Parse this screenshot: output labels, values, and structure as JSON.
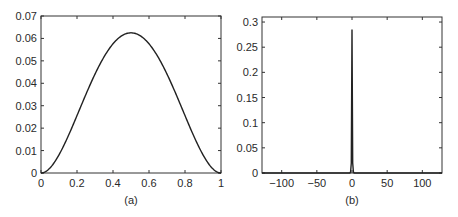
{
  "chart_data": [
    {
      "type": "line",
      "panel": "(a)",
      "caption": "(a)",
      "title": "",
      "xlabel": "",
      "ylabel": "",
      "xlim": [
        0,
        1
      ],
      "ylim": [
        0,
        0.07
      ],
      "xticks": [
        "0",
        "0.2",
        "0.4",
        "0.6",
        "0.8",
        "1"
      ],
      "yticks": [
        "0",
        "0.01",
        "0.02",
        "0.03",
        "0.04",
        "0.05",
        "0.06",
        "0.07"
      ],
      "grid": false,
      "legend": null,
      "series": [
        {
          "name": "f(x)",
          "x": [
            0,
            0.05,
            0.1,
            0.15,
            0.2,
            0.25,
            0.3,
            0.35,
            0.4,
            0.45,
            0.5,
            0.55,
            0.6,
            0.65,
            0.7,
            0.75,
            0.8,
            0.85,
            0.9,
            0.95,
            1
          ],
          "values": [
            0,
            0.0023,
            0.0081,
            0.0163,
            0.0256,
            0.0352,
            0.0441,
            0.0518,
            0.0576,
            0.0613,
            0.0625,
            0.0613,
            0.0576,
            0.0518,
            0.0441,
            0.0352,
            0.0256,
            0.0163,
            0.0081,
            0.0023,
            0
          ]
        }
      ]
    },
    {
      "type": "line",
      "panel": "(b)",
      "caption": "(b)",
      "title": "",
      "xlabel": "",
      "ylabel": "",
      "xlim": [
        -128,
        128
      ],
      "ylim": [
        0,
        0.31
      ],
      "xticks": [
        "-100",
        "-50",
        "0",
        "50",
        "100"
      ],
      "yticks": [
        "0",
        "0.05",
        "0.1",
        "0.15",
        "0.2",
        "0.25",
        "0.3"
      ],
      "grid": false,
      "legend": null,
      "series": [
        {
          "name": "spectrum",
          "x": [
            -128,
            -3,
            -2,
            -1,
            0,
            1,
            2,
            3,
            128
          ],
          "values": [
            0,
            0,
            0.002,
            0.02,
            0.285,
            0.02,
            0.002,
            0,
            0
          ]
        }
      ]
    }
  ],
  "captions": {
    "a": "(a)",
    "b": "(b)"
  }
}
